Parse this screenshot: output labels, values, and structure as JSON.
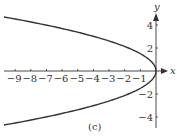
{
  "chart_data": {
    "type": "line",
    "title": "",
    "caption": "(c)",
    "xlabel": "x",
    "ylabel": "y",
    "xlim": [
      -9.7,
      0.8
    ],
    "ylim": [
      -4.8,
      4.8
    ],
    "x_ticks": [
      -9,
      -8,
      -7,
      -6,
      -5,
      -4,
      -3,
      -2,
      -1
    ],
    "x_tick_labels": [
      "−9",
      "−8",
      "−7",
      "−6",
      "−5",
      "−4",
      "−3",
      "−2",
      "−1"
    ],
    "y_ticks": [
      4,
      2,
      -2,
      -4
    ],
    "y_tick_labels": [
      "4",
      "2",
      "−2",
      "−4"
    ],
    "grid": false,
    "legend": null,
    "series": [
      {
        "name": "parabola opening left (x ≈ -0.44·y²)",
        "color": "#333333",
        "points": [
          {
            "x": -9.7,
            "y": 4.7
          },
          {
            "x": -7.1,
            "y": 4.0
          },
          {
            "x": -4.0,
            "y": 3.0
          },
          {
            "x": -1.8,
            "y": 2.0
          },
          {
            "x": -0.44,
            "y": 1.0
          },
          {
            "x": 0,
            "y": 0
          },
          {
            "x": -0.44,
            "y": -1.0
          },
          {
            "x": -1.8,
            "y": -2.0
          },
          {
            "x": -4.0,
            "y": -3.0
          },
          {
            "x": -7.1,
            "y": -4.0
          },
          {
            "x": -9.7,
            "y": -4.7
          }
        ]
      }
    ]
  },
  "colors": {
    "ink": "#333333",
    "background": "#ffffff"
  }
}
